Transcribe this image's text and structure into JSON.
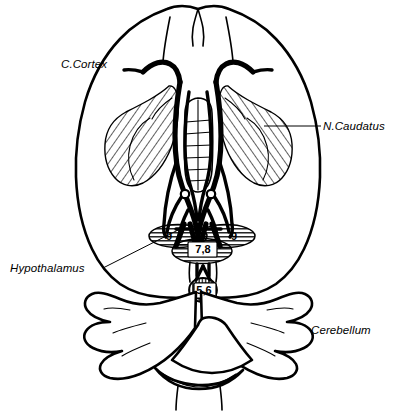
{
  "figure": {
    "background_color": "#ffffff",
    "line_color": "#000000"
  },
  "labels": [
    {
      "id": "c-cortex",
      "text": "C.Cortex",
      "x": 61,
      "y": 68,
      "anchor": "start",
      "has_leader": false
    },
    {
      "id": "n-caudatus",
      "text": "N.Caudatus",
      "x": 323,
      "y": 130,
      "anchor": "start",
      "has_leader": true
    },
    {
      "id": "hypothalamus",
      "text": "Hypothalamus",
      "x": 10,
      "y": 272,
      "anchor": "start",
      "has_leader": true
    },
    {
      "id": "cerebellum",
      "text": "Cerebellum",
      "x": 311,
      "y": 334,
      "anchor": "start",
      "has_leader": false
    }
  ],
  "numbered_regions": [
    {
      "id": "region-9-left",
      "value": "9",
      "x": 169,
      "y": 240,
      "description": "left lateral hatched oval"
    },
    {
      "id": "region-9-right",
      "value": "9",
      "x": 234,
      "y": 240,
      "description": "right lateral hatched oval"
    },
    {
      "id": "region-78",
      "value": "7,8",
      "x": 203,
      "y": 253,
      "description": "central hatched oval boxed label"
    },
    {
      "id": "region-56",
      "value": "5,6",
      "x": 204,
      "y": 293,
      "description": "lower midline hatched oval boxed label"
    }
  ],
  "structures": [
    {
      "id": "cerebral-cortex",
      "name": "Cerebral cortex outline"
    },
    {
      "id": "caudate-left",
      "name": "Left nucleus caudatus (hatched)"
    },
    {
      "id": "caudate-right",
      "name": "Right nucleus caudatus (hatched)"
    },
    {
      "id": "thalamus-midline",
      "name": "Midline thalamic / ladder structure"
    },
    {
      "id": "fiber-tracts",
      "name": "Thick black fiber tract bands"
    },
    {
      "id": "mammillary-bodies",
      "name": "Paired small ring structures"
    },
    {
      "id": "hypothalamic-ovals",
      "name": "Hatched hypothalamic nuclei ovals"
    },
    {
      "id": "cerebellum-body",
      "name": "Cerebellum lobed hemispheres"
    },
    {
      "id": "brainstem",
      "name": "Brainstem / medulla"
    }
  ]
}
